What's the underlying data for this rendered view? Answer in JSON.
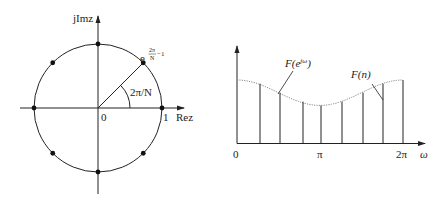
{
  "left_diagram": {
    "y_axis_label": "jImz",
    "x_axis_label": "Rez",
    "origin_label": "0",
    "unit_label": "1",
    "angle_label": "2π/N",
    "point_label_base": "e",
    "point_label_exp_num": "2π",
    "point_label_exp_den": "N",
    "point_label_exp_suffix": "−1",
    "num_points": 8
  },
  "right_diagram": {
    "x_ticks": [
      "0",
      "π",
      "2π"
    ],
    "x_axis_label": "ω",
    "curve_label": "F(e^jω)",
    "curve_label_main": "F(e",
    "curve_label_sup": "jω",
    "curve_label_close": ")",
    "samples_label": "F(n)"
  },
  "chart_data": {
    "type": "line",
    "title": "",
    "xlabel": "ω",
    "ylabel": "",
    "x_ticks": [
      "0",
      "π",
      "2π"
    ],
    "series": [
      {
        "name": "F(e^jω) (continuous, dotted)",
        "x": [
          0,
          0.785,
          1.571,
          2.356,
          3.142,
          3.927,
          4.712,
          5.498,
          6.283
        ],
        "values": [
          1.0,
          0.93,
          0.78,
          0.64,
          0.6,
          0.64,
          0.78,
          0.93,
          1.0
        ]
      },
      {
        "name": "F(n) (samples, stems)",
        "x": [
          0.785,
          1.571,
          2.356,
          3.142,
          3.927,
          4.712,
          5.498,
          6.283
        ],
        "values": [
          0.93,
          0.78,
          0.64,
          0.6,
          0.64,
          0.78,
          0.93,
          1.0
        ]
      }
    ]
  }
}
